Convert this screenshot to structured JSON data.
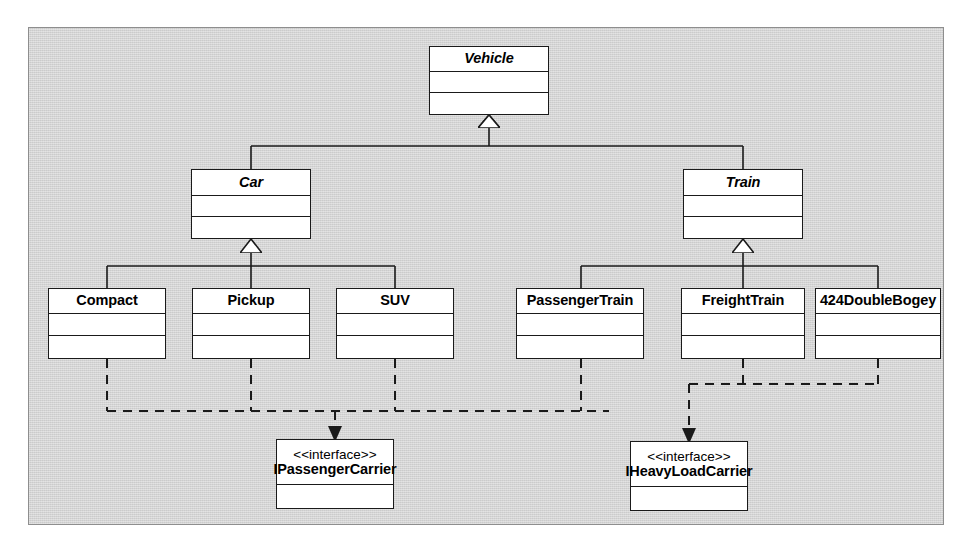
{
  "diagram": {
    "kind": "uml-class-diagram",
    "canvas_color": "#d3d3d3",
    "box_fill": "#ffffff",
    "line_color": "#1a1a1a",
    "classes": [
      {
        "id": "vehicle",
        "name": "Vehicle",
        "abstract": true,
        "compartments": 3
      },
      {
        "id": "car",
        "name": "Car",
        "abstract": true,
        "compartments": 3
      },
      {
        "id": "train",
        "name": "Train",
        "abstract": true,
        "compartments": 3
      },
      {
        "id": "compact",
        "name": "Compact",
        "abstract": false,
        "compartments": 3
      },
      {
        "id": "pickup",
        "name": "Pickup",
        "abstract": false,
        "compartments": 3
      },
      {
        "id": "suv",
        "name": "SUV",
        "abstract": false,
        "compartments": 3
      },
      {
        "id": "passengertrain",
        "name": "PassengerTrain",
        "abstract": false,
        "compartments": 3
      },
      {
        "id": "freighttrain",
        "name": "FreightTrain",
        "abstract": false,
        "compartments": 3
      },
      {
        "id": "doublebogey",
        "name": "424DoubleBogey",
        "abstract": false,
        "compartments": 3
      }
    ],
    "interfaces": [
      {
        "id": "ipassengercarrier",
        "stereotype": "<<interface>>",
        "name": "IPassengerCarrier",
        "compartments": 2
      },
      {
        "id": "iheavyloadcarrier",
        "stereotype": "<<interface>>",
        "name": "IHeavyLoadCarrier",
        "compartments": 2
      }
    ],
    "generalizations": [
      {
        "from": "car",
        "to": "vehicle"
      },
      {
        "from": "train",
        "to": "vehicle"
      },
      {
        "from": "compact",
        "to": "car"
      },
      {
        "from": "pickup",
        "to": "car"
      },
      {
        "from": "suv",
        "to": "car"
      },
      {
        "from": "passengertrain",
        "to": "train"
      },
      {
        "from": "freighttrain",
        "to": "train"
      },
      {
        "from": "doublebogey",
        "to": "train"
      }
    ],
    "realizations": [
      {
        "from": "compact",
        "to": "ipassengercarrier"
      },
      {
        "from": "pickup",
        "to": "ipassengercarrier"
      },
      {
        "from": "suv",
        "to": "ipassengercarrier"
      },
      {
        "from": "passengertrain",
        "to": "ipassengercarrier"
      },
      {
        "from": "freighttrain",
        "to": "iheavyloadcarrier"
      },
      {
        "from": "doublebogey",
        "to": "iheavyloadcarrier"
      }
    ]
  }
}
